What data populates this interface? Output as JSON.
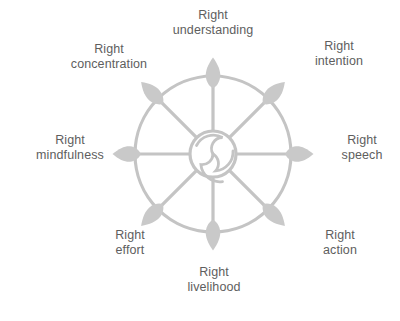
{
  "diagram": {
    "type": "radial-wheel-diagram",
    "colors": {
      "background": "#ffffff",
      "wheel_stroke": "#c4c4c4",
      "petal_fill": "#c9c9c9",
      "hub_stroke": "#c4c4c4",
      "label_text": "#5e5e5e"
    },
    "geometry": {
      "center_x": 213,
      "center_y": 154,
      "rim_radius": 78,
      "hub_radius": 23,
      "petal_tip_radius": 96,
      "spoke_count": 8
    },
    "hub": {
      "name": "triskelion-spiral",
      "arms": 3
    },
    "spokes": [
      {
        "id": "understanding",
        "angle_deg": 90,
        "line1": "Right",
        "line2": "understanding"
      },
      {
        "id": "intention",
        "angle_deg": 45,
        "line1": "Right",
        "line2": "intention"
      },
      {
        "id": "speech",
        "angle_deg": 0,
        "line1": "Right",
        "line2": "speech"
      },
      {
        "id": "action",
        "angle_deg": -45,
        "line1": "Right",
        "line2": "action"
      },
      {
        "id": "livelihood",
        "angle_deg": -90,
        "line1": "Right",
        "line2": "livelihood"
      },
      {
        "id": "effort",
        "angle_deg": -135,
        "line1": "Right",
        "line2": "effort"
      },
      {
        "id": "mindfulness",
        "angle_deg": 180,
        "line1": "Right",
        "line2": "mindfulness"
      },
      {
        "id": "concentration",
        "angle_deg": 135,
        "line1": "Right",
        "line2": "concentration"
      }
    ]
  }
}
